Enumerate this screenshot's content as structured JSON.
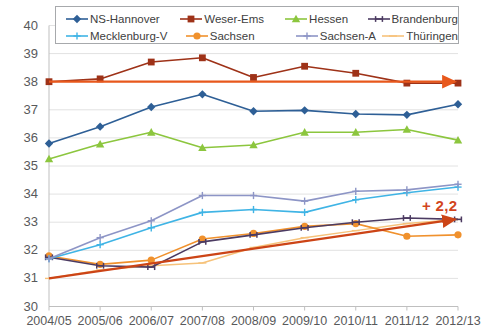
{
  "chart_data": {
    "type": "line",
    "title": "",
    "subtitle": "",
    "xlabel": "",
    "ylabel": "",
    "grid": true,
    "legend_position": "top",
    "ylim": [
      30,
      40
    ],
    "ytick_step": 1,
    "yticks": [
      "40",
      "39",
      "38",
      "37",
      "36",
      "35",
      "34",
      "33",
      "32",
      "31",
      "30"
    ],
    "categories": [
      "2004/05",
      "2005/06",
      "2006/07",
      "2007/08",
      "2008/09",
      "2009/10",
      "2010/11",
      "2011/12",
      "2012/13"
    ],
    "series": [
      {
        "name": "NS-Hannover",
        "color": "#2e5f96",
        "marker": "diamond",
        "values": [
          35.8,
          36.4,
          37.1,
          37.55,
          36.95,
          36.98,
          36.85,
          36.82,
          37.2
        ]
      },
      {
        "name": "Weser-Ems",
        "color": "#9e3218",
        "marker": "square",
        "values": [
          38.0,
          38.1,
          38.7,
          38.85,
          38.15,
          38.55,
          38.3,
          37.95,
          37.95
        ]
      },
      {
        "name": "Hessen",
        "color": "#8cc63e",
        "marker": "triangle",
        "values": [
          35.25,
          35.78,
          36.2,
          35.65,
          35.75,
          36.2,
          36.2,
          36.3,
          35.92
        ]
      },
      {
        "name": "Brandenburg",
        "color": "#4c3b62",
        "marker": "bar",
        "values": [
          31.75,
          31.45,
          31.4,
          32.3,
          32.55,
          32.8,
          33.0,
          33.15,
          33.1
        ]
      },
      {
        "name": "Mecklenburg-V",
        "color": "#3fb4e5",
        "marker": "plus",
        "values": [
          31.7,
          32.2,
          32.8,
          33.35,
          33.45,
          33.35,
          33.8,
          34.05,
          34.25
        ]
      },
      {
        "name": "Sachsen",
        "color": "#f0912d",
        "marker": "circle",
        "values": [
          31.8,
          31.5,
          31.65,
          32.4,
          32.6,
          32.85,
          32.95,
          32.5,
          32.55
        ]
      },
      {
        "name": "Sachsen-A",
        "color": "#8d95c6",
        "marker": "plus",
        "values": [
          31.7,
          32.45,
          33.05,
          33.95,
          33.95,
          33.75,
          34.1,
          34.15,
          34.35
        ]
      },
      {
        "name": "Thüringen",
        "color": "#f6c27a",
        "marker": "line",
        "values": [
          31.0,
          31.3,
          31.45,
          31.55,
          32.1,
          32.45,
          32.7,
          32.95,
          33.1
        ]
      }
    ],
    "annotations": [
      {
        "name": "trend-flat-weser-ems",
        "label": "",
        "color": "#e8581c",
        "from": {
          "x": "2004/05",
          "y": 38.0
        },
        "to": {
          "x": "2012/13",
          "y": 38.0
        },
        "arrow": true
      },
      {
        "name": "trend-rising-thueringen",
        "label": "+ 2,2",
        "color": "#cc4416",
        "from": {
          "x": "2004/05",
          "y": 31.0
        },
        "to": {
          "x": "2012/13",
          "y": 33.1
        },
        "arrow": true
      }
    ],
    "delta_label": "+ 2,2"
  },
  "legend": {
    "entries": [
      {
        "label": "NS-Hannover"
      },
      {
        "label": "Weser-Ems"
      },
      {
        "label": "Hessen"
      },
      {
        "label": "Brandenburg"
      },
      {
        "label": "Mecklenburg-V"
      },
      {
        "label": "Sachsen"
      },
      {
        "label": "Sachsen-A"
      },
      {
        "label": "Thüringen"
      }
    ]
  }
}
